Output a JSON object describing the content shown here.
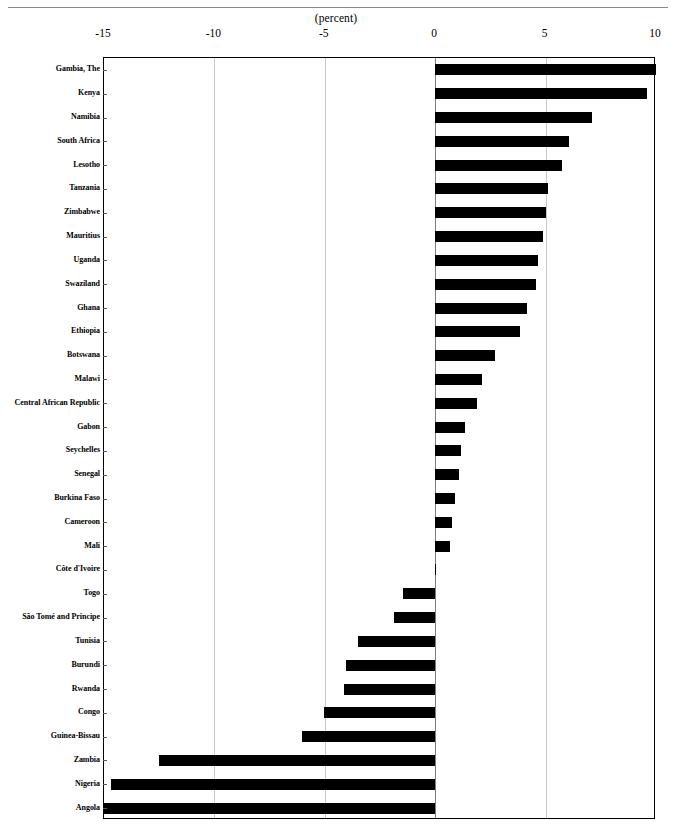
{
  "figure": {
    "cutoff_title": "",
    "units_label": "(percent)"
  },
  "axis": {
    "tick_labels": [
      "-15",
      "-10",
      "-5",
      "0",
      "5",
      "10"
    ],
    "tick_values": [
      -15,
      -10,
      -5,
      0,
      5,
      10
    ]
  },
  "chart_data": {
    "type": "bar",
    "orientation": "horizontal",
    "title": "",
    "subtitle": "",
    "xlabel": "(percent)",
    "ylabel": "",
    "xlim": [
      -15,
      10
    ],
    "ylim": null,
    "grid": "vertical gridlines at -10, -5, 5; zero reference line at 0",
    "legend": "none",
    "categories": [
      "Gambia, The",
      "Kenya",
      "Namibia",
      "South Africa",
      "Lesotho",
      "Tanzania",
      "Zimbabwe",
      "Mauritius",
      "Uganda",
      "Swaziland",
      "Ghana",
      "Ethiopia",
      "Botswana",
      "Malawi",
      "Central African Republic",
      "Gabon",
      "Seychelles",
      "Senegal",
      "Burkina Faso",
      "Cameroon",
      "Mali",
      "Côte d'Ivoire",
      "Togo",
      "São Tomé and Principe",
      "Tunisia",
      "Burundi",
      "Rwanda",
      "Congo",
      "Guinea-Bissau",
      "Zambia",
      "Nigeria",
      "Angola"
    ],
    "values": [
      10.0,
      9.6,
      7.1,
      6.05,
      5.75,
      5.1,
      5.0,
      4.9,
      4.65,
      4.55,
      4.15,
      3.85,
      2.7,
      2.1,
      1.9,
      1.35,
      1.15,
      1.1,
      0.9,
      0.78,
      0.68,
      0.05,
      -1.45,
      -1.85,
      -3.5,
      -4.05,
      -4.15,
      -5.05,
      -6.05,
      -12.5,
      -14.7,
      -15.0
    ],
    "bar_color": "#000000"
  }
}
